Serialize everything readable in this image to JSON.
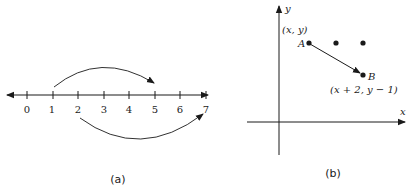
{
  "panel_a": {
    "caption": "(a)",
    "tick_labels": [
      "0",
      "1",
      "2",
      "3",
      "4",
      "5",
      "6",
      "7"
    ],
    "arcs": [
      {
        "from": "1",
        "to": "5",
        "side": "above"
      },
      {
        "from": "2",
        "to": "7",
        "side": "below"
      }
    ]
  },
  "panel_b": {
    "caption": "(b)",
    "x_axis_label": "x",
    "y_axis_label": "y",
    "point_a_label": "A",
    "point_a_coords": "(x, y)",
    "point_b_label": "B",
    "point_b_coords": "(x + 2,  y − 1)",
    "extra_dots": 2
  },
  "colors": {
    "ink": "#1a1a1a",
    "background": "#ffffff"
  }
}
